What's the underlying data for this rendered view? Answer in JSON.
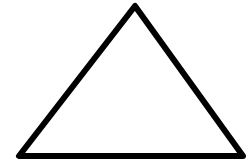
{
  "diagram": {
    "shape": "triangle",
    "background": "#ffffff",
    "stroke_color": "#000000",
    "fill_color": "#ffffff",
    "stroke_width": 6,
    "vertices": {
      "apex": [
        135,
        6
      ],
      "bottom_left": [
        19,
        156
      ],
      "bottom_right": [
        243,
        156
      ]
    }
  }
}
